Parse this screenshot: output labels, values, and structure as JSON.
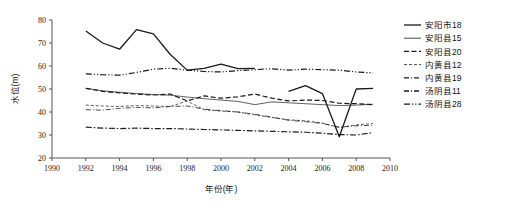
{
  "chart_data": {
    "type": "line",
    "title": "",
    "xlabel": "年份(年)",
    "ylabel": "水位(m)",
    "xlim": [
      1990,
      2010
    ],
    "ylim": [
      20,
      80
    ],
    "xticks": [
      1990,
      1992,
      1994,
      1996,
      1998,
      2000,
      2002,
      2004,
      2006,
      2008,
      2010
    ],
    "yticks": [
      20,
      30,
      40,
      50,
      60,
      70,
      80
    ],
    "xtick_labels": [
      "1990",
      "1992",
      "1994",
      "1996",
      "1998",
      "2000",
      "2002",
      "2004",
      "2006",
      "2008",
      "2010"
    ],
    "ytick_labels": [
      "20",
      "30",
      "40",
      "50",
      "60",
      "70",
      "80"
    ],
    "grid": false,
    "legend_position": "right",
    "series": [
      {
        "name": "安阳市18",
        "style": "solid",
        "stroke_width": 1.3,
        "color": "#1a1a1a",
        "x": [
          1992,
          1993,
          1994,
          1995,
          1996,
          1997,
          1998,
          1999,
          2000,
          2001,
          2002
        ],
        "values": [
          75.2,
          70.0,
          67.3,
          75.8,
          74.0,
          65.0,
          58.2,
          59.0,
          60.8,
          58.9,
          59.0
        ]
      },
      {
        "name": "安阳市18",
        "style": "solid",
        "stroke_width": 1.3,
        "color": "#1a1a1a",
        "x": [
          2004,
          2005,
          2006,
          2007,
          2008,
          2009
        ],
        "values": [
          49.0,
          51.5,
          48.0,
          29.2,
          50.0,
          50.3
        ]
      },
      {
        "name": "安阳县15",
        "style": "thin-solid",
        "stroke_width": 0.7,
        "color": "#2b2b2b",
        "x": [
          1992,
          1993,
          1994,
          1995,
          1996,
          1997,
          1998,
          1999,
          2000,
          2001,
          2002,
          2003,
          2004,
          2005,
          2006,
          2007,
          2008,
          2009
        ],
        "values": [
          50.3,
          49.2,
          48.6,
          48.0,
          47.6,
          47.3,
          46.5,
          45.8,
          45.2,
          44.6,
          43.2,
          44.4,
          44.0,
          43.6,
          43.2,
          42.8,
          43.0,
          43.4
        ]
      },
      {
        "name": "安阳县20",
        "style": "dashed",
        "stroke_width": 1.2,
        "color": "#1a1a1a",
        "x": [
          1992,
          1993,
          1994,
          1995,
          1996,
          1997,
          1998,
          1999,
          2000,
          2001,
          2002,
          2003,
          2004,
          2005,
          2006,
          2007,
          2008,
          2009
        ],
        "values": [
          50.3,
          49.0,
          48.3,
          47.8,
          47.4,
          47.8,
          44.8,
          47.0,
          46.0,
          46.6,
          47.8,
          46.0,
          44.8,
          45.2,
          45.0,
          43.8,
          43.6,
          43.2
        ]
      },
      {
        "name": "内黄县12",
        "style": "fine-dash",
        "stroke_width": 0.7,
        "color": "#555555",
        "x": [
          1992,
          1993,
          1994,
          1995,
          1996,
          1997,
          1998,
          1999,
          2000,
          2001,
          2002,
          2003,
          2004,
          2005,
          2006,
          2007,
          2008,
          2009
        ],
        "values": [
          43.0,
          42.6,
          42.4,
          42.8,
          42.6,
          42.4,
          44.8,
          41.0,
          40.4,
          40.0,
          38.8,
          37.6,
          36.6,
          36.2,
          35.2,
          33.2,
          34.4,
          35.0
        ]
      },
      {
        "name": "内黄县19",
        "style": "dash-dot",
        "stroke_width": 0.8,
        "color": "#555555",
        "x": [
          1992,
          1993,
          1994,
          1995,
          1996,
          1997,
          1998,
          1999,
          2000,
          2001,
          2002,
          2003,
          2004,
          2005,
          2006,
          2007,
          2008,
          2009
        ],
        "values": [
          41.0,
          40.8,
          41.6,
          42.0,
          41.8,
          42.4,
          42.6,
          41.2,
          40.6,
          40.0,
          39.0,
          37.8,
          36.4,
          35.8,
          35.0,
          33.4,
          34.0,
          34.2
        ]
      },
      {
        "name": "汤阴县11",
        "style": "dash-dot-heavy",
        "stroke_width": 1.2,
        "color": "#1a1a1a",
        "x": [
          1992,
          1993,
          1994,
          1995,
          1996,
          1997,
          1998,
          1999,
          2000,
          2001,
          2002,
          2003,
          2004,
          2005,
          2006,
          2007,
          2008,
          2009
        ],
        "values": [
          33.4,
          33.0,
          32.8,
          33.0,
          32.8,
          32.8,
          32.6,
          32.4,
          32.2,
          32.0,
          31.8,
          31.6,
          31.4,
          31.2,
          30.8,
          30.2,
          30.0,
          31.0
        ]
      },
      {
        "name": "汤阴县28",
        "style": "dash-dot-dot",
        "stroke_width": 1.2,
        "color": "#1a1a1a",
        "x": [
          1992,
          1993,
          1994,
          1995,
          1996,
          1997,
          1998,
          1999,
          2000,
          2001,
          2002,
          2003,
          2004,
          2005,
          2006,
          2007,
          2008,
          2009
        ],
        "values": [
          56.6,
          56.2,
          56.0,
          57.2,
          58.6,
          59.0,
          58.2,
          57.6,
          57.4,
          58.0,
          58.4,
          58.8,
          58.2,
          58.6,
          58.4,
          58.2,
          57.4,
          57.0
        ]
      }
    ]
  },
  "legend": {
    "items": [
      {
        "label": "安阳市18",
        "style": "solid"
      },
      {
        "label": "安阳县15",
        "style": "thin-solid"
      },
      {
        "label": "安阳县20",
        "style": "dashed"
      },
      {
        "label": "内黄县12",
        "style": "fine-dash"
      },
      {
        "label": "内黄县19",
        "style": "dash-dot"
      },
      {
        "label": "汤阴县11",
        "style": "dash-dot"
      },
      {
        "label": "汤阴县28",
        "style": "dash-dot-dot"
      }
    ]
  }
}
